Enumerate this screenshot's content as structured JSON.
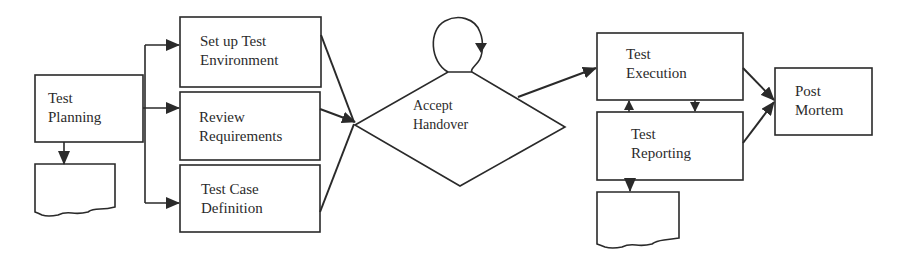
{
  "diagram": {
    "type": "process-flowchart",
    "colors": {
      "stroke": "#2a2a2a",
      "background": "#ffffff",
      "text": "#2b2b2b"
    },
    "nodes": {
      "test_planning": {
        "shape": "rectangle",
        "lines": [
          "Test",
          "Planning"
        ]
      },
      "planning_document": {
        "shape": "document",
        "lines": []
      },
      "setup_environment": {
        "shape": "rectangle",
        "lines": [
          "Set up Test",
          "Environment"
        ]
      },
      "review_requirements": {
        "shape": "rectangle",
        "lines": [
          "Review",
          "Requirements"
        ]
      },
      "test_case_definition": {
        "shape": "rectangle",
        "lines": [
          "Test Case",
          "Definition"
        ]
      },
      "accept_handover": {
        "shape": "diamond",
        "lines": [
          "Accept",
          "Handover"
        ]
      },
      "handover_loop": {
        "shape": "self-loop",
        "lines": []
      },
      "test_execution": {
        "shape": "rectangle",
        "lines": [
          "Test",
          "Execution"
        ]
      },
      "test_reporting": {
        "shape": "rectangle",
        "lines": [
          "Test",
          "Reporting"
        ]
      },
      "reporting_document": {
        "shape": "document",
        "lines": []
      },
      "post_mortem": {
        "shape": "rectangle",
        "lines": [
          "Post",
          "Mortem"
        ]
      }
    },
    "edges": [
      {
        "from": "test_planning",
        "to": "setup_environment"
      },
      {
        "from": "test_planning",
        "to": "review_requirements"
      },
      {
        "from": "test_planning",
        "to": "test_case_definition"
      },
      {
        "from": "test_planning",
        "to": "planning_document"
      },
      {
        "from": "setup_environment",
        "to": "accept_handover"
      },
      {
        "from": "review_requirements",
        "to": "accept_handover"
      },
      {
        "from": "test_case_definition",
        "to": "accept_handover"
      },
      {
        "from": "accept_handover",
        "to": "accept_handover"
      },
      {
        "from": "accept_handover",
        "to": "test_execution"
      },
      {
        "from": "test_execution",
        "to": "test_reporting"
      },
      {
        "from": "test_reporting",
        "to": "test_execution"
      },
      {
        "from": "test_reporting",
        "to": "reporting_document"
      },
      {
        "from": "test_execution",
        "to": "post_mortem"
      },
      {
        "from": "test_reporting",
        "to": "post_mortem"
      }
    ]
  }
}
